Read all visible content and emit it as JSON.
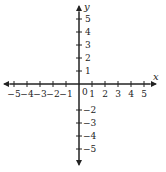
{
  "diagram": {
    "type": "cartesian-coordinate-plane",
    "axis_color": "#222222",
    "x_axis": {
      "label": "x",
      "ticks": [
        -5,
        -4,
        -3,
        -2,
        -1,
        1,
        2,
        3,
        4,
        5
      ],
      "tick_labels": [
        "−5",
        "−4",
        "−3",
        "−2",
        "−1",
        "1",
        "2",
        "3",
        "4",
        "5"
      ]
    },
    "y_axis": {
      "label": "y",
      "ticks": [
        5,
        4,
        3,
        2,
        1,
        -2,
        -3,
        -4,
        -5
      ],
      "tick_labels": [
        "5",
        "4",
        "3",
        "2",
        "1",
        "−2",
        "−3",
        "−4",
        "−5"
      ]
    },
    "origin_label": "0"
  }
}
